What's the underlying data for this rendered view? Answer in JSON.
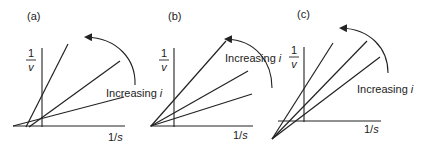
{
  "figure": {
    "panels": [
      {
        "label": "(a)",
        "y_axis_label_num": "1",
        "y_axis_label_den": "v",
        "x_axis_label_num": "1/",
        "x_axis_label_var": "s",
        "annotation_prefix": "Increasing ",
        "annotation_var": "i",
        "description": "Lines intersect left of the y-axis, above the x-axis"
      },
      {
        "label": "(b)",
        "y_axis_label_num": "1",
        "y_axis_label_den": "v",
        "x_axis_label_num": "1/",
        "x_axis_label_var": "s",
        "annotation_prefix": "Increasing ",
        "annotation_var": "i",
        "description": "Lines intersect on the x-axis, left of the y-axis"
      },
      {
        "label": "(c)",
        "y_axis_label_num": "1",
        "y_axis_label_den": "v",
        "x_axis_label_num": "1/",
        "x_axis_label_var": "s",
        "annotation_prefix": "Increasing ",
        "annotation_var": "i",
        "description": "Lines intersect below the x-axis, left of the y-axis"
      }
    ]
  },
  "colors": {
    "ink": "#222222",
    "background": "#ffffff"
  }
}
